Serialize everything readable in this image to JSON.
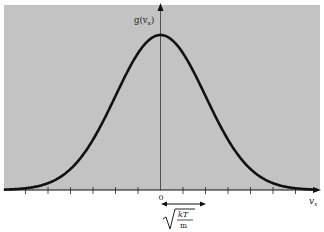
{
  "chart_data": {
    "type": "line",
    "title": "",
    "xlabel": "v_x",
    "ylabel": "g(v_x)",
    "x_tick_label_zero": "0",
    "x_ticks_count_each_side": 6,
    "tick_spacing_in_sigma": 0.5,
    "width_annotation": {
      "label_numerator": "kT",
      "label_denominator": "m",
      "description": "sqrt(kT/m) — double-headed arrow spanning from 0 to one standard deviation"
    },
    "series": [
      {
        "name": "g(v_x)",
        "shape": "gaussian",
        "mean": 0,
        "sigma_units": 1,
        "x_sigma": [
          -3.5,
          -3,
          -2.5,
          -2,
          -1.5,
          -1,
          -0.5,
          0,
          0.5,
          1,
          1.5,
          2,
          2.5,
          3,
          3.5
        ],
        "y_relative": [
          0.002,
          0.011,
          0.044,
          0.135,
          0.325,
          0.607,
          0.882,
          1.0,
          0.882,
          0.607,
          0.325,
          0.135,
          0.044,
          0.011,
          0.002
        ]
      }
    ],
    "grid": false,
    "legend": "none",
    "background_color": "#c3c3c3",
    "curve_color": "#111111"
  },
  "labels": {
    "y_axis": "g(v",
    "y_axis_sub": "x",
    "y_axis_close": ")",
    "x_axis": "v",
    "x_axis_sub": "x",
    "zero": "0",
    "sqrt_num": "kT",
    "sqrt_den": "m"
  }
}
